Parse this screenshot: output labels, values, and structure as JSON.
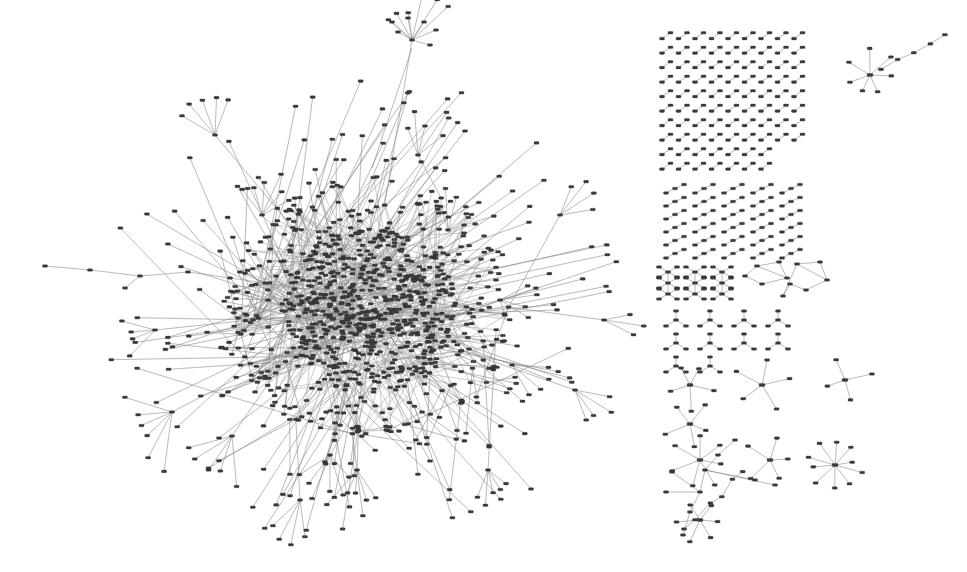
{
  "figure": {
    "type": "node-link-diagram",
    "width": 967,
    "height": 572,
    "background_color": "#ffffff",
    "node_color": "#3b3b3b",
    "edge_color": "#8c8c8c",
    "node_shape": "rounded-rectangle",
    "node_width": 5,
    "node_height": 2.6,
    "edge_width": 0.6
  },
  "chart_data": {
    "type": "scatter",
    "xlabel": "",
    "ylabel": "",
    "grid": false,
    "legend": null,
    "xlim": [
      0,
      967
    ],
    "ylim": [
      0,
      572
    ],
    "components": {
      "giant_component": {
        "center_x": 370,
        "center_y": 310,
        "core_radius": 85,
        "halo_radius": 150,
        "core_nodes": 620,
        "halo_nodes": 240,
        "periphery_nodes": 190,
        "total_nodes": 1050
      },
      "dyad_grid": {
        "label": "dyads",
        "origin_x": 662,
        "origin_y": 34,
        "columns": 9,
        "rows": 10,
        "col_spacing": 16.5,
        "row_spacing": 14.5,
        "nodes_per_component": 2
      },
      "triad_grid": {
        "label": "triads",
        "origin_x": 666,
        "origin_y": 186,
        "columns": 5,
        "rows": 6,
        "col_spacing": 29,
        "row_spacing": 13,
        "nodes_per_component": 3
      },
      "cross_row": {
        "label": "crosses",
        "origin_x": 668,
        "origin_y": 272,
        "count": 3,
        "spacing": 27
      },
      "cycle_components": {
        "label": "cycles",
        "count": 2,
        "positions": [
          [
            760,
            272
          ],
          [
            800,
            276
          ]
        ]
      },
      "y_grid": {
        "label": "y-shaped",
        "origin_x": 676,
        "origin_y": 320,
        "columns": 4,
        "rows": 3,
        "col_spacing": 34,
        "row_spacing": 23
      },
      "star_components": {
        "label": "stars",
        "items": [
          {
            "x": 690,
            "y": 385,
            "spokes": 5
          },
          {
            "x": 762,
            "y": 385,
            "spokes": 5
          },
          {
            "x": 845,
            "y": 380,
            "spokes": 4
          },
          {
            "x": 690,
            "y": 424,
            "spokes": 5
          },
          {
            "x": 700,
            "y": 460,
            "spokes": 7
          },
          {
            "x": 770,
            "y": 460,
            "spokes": 5
          },
          {
            "x": 835,
            "y": 465,
            "spokes": 10
          },
          {
            "x": 700,
            "y": 520,
            "spokes": 6
          },
          {
            "x": 870,
            "y": 75,
            "spokes": 7
          }
        ]
      },
      "chain_components": {
        "label": "chains",
        "items": [
          {
            "start_x": 880,
            "start_y": 70,
            "end_x": 945,
            "end_y": 35,
            "nodes": 5
          },
          {
            "start_x": 683,
            "start_y": 530,
            "end_x": 745,
            "end_y": 470,
            "nodes": 6
          }
        ]
      },
      "left_tail": {
        "label": "long-chain-tail",
        "start_x": 45,
        "start_y": 266,
        "end_x": 230,
        "end_y": 280,
        "nodes": 6
      }
    }
  }
}
